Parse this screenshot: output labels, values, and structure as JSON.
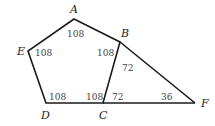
{
  "diagram": {
    "type": "geometry",
    "vertices": {
      "A": {
        "label": "A",
        "x": 74,
        "y": 19
      },
      "B": {
        "label": "B",
        "x": 120,
        "y": 42
      },
      "C": {
        "label": "C",
        "x": 103,
        "y": 103
      },
      "D": {
        "label": "D",
        "x": 46,
        "y": 103
      },
      "E": {
        "label": "E",
        "x": 28,
        "y": 51
      },
      "F": {
        "label": "F",
        "x": 195,
        "y": 103
      }
    },
    "edges": [
      [
        "A",
        "B"
      ],
      [
        "B",
        "C"
      ],
      [
        "C",
        "D"
      ],
      [
        "D",
        "E"
      ],
      [
        "E",
        "A"
      ],
      [
        "B",
        "F"
      ],
      [
        "C",
        "F"
      ]
    ],
    "angles": {
      "A": "108",
      "E": "108",
      "B_pentagon": "108",
      "B_triangle": "72",
      "D": "108",
      "C_pentagon": "108",
      "C_triangle": "72",
      "F": "36"
    },
    "colors": {
      "stroke": "#1a1a1a",
      "vertex_label": "#222222",
      "angle_label": "#444444",
      "background": "#ffffff"
    }
  }
}
